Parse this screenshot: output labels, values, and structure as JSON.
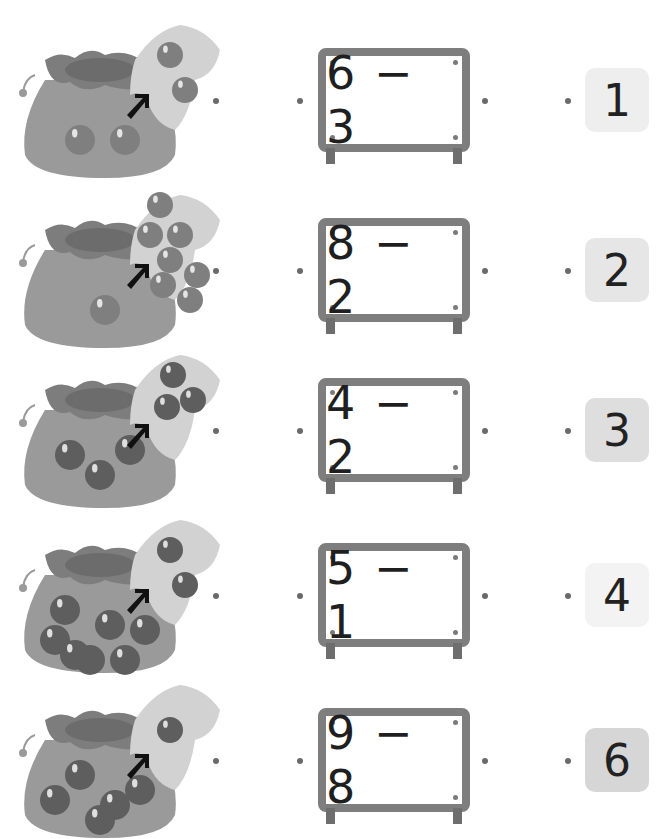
{
  "worksheet": {
    "rows": [
      {
        "bag_balls": 2,
        "hand_balls": 2,
        "expression": "6 − 3",
        "answer": "1",
        "answer_bg": "#eeeeee"
      },
      {
        "bag_balls": 1,
        "hand_balls": 7,
        "expression": "8 − 2",
        "answer": "2",
        "answer_bg": "#e6e6e6"
      },
      {
        "bag_balls": 3,
        "hand_balls": 3,
        "expression": "4 − 2",
        "answer": "3",
        "answer_bg": "#dedede"
      },
      {
        "bag_balls": 7,
        "hand_balls": 2,
        "expression": "5 − 1",
        "answer": "4",
        "answer_bg": "#f3f3f3"
      },
      {
        "bag_balls": 5,
        "hand_balls": 1,
        "expression": "9 − 8",
        "answer": "6",
        "answer_bg": "#d6d6d6"
      }
    ]
  },
  "colors": {
    "bag": "#9a9a9a",
    "bag_top": "#7d7d7d",
    "bag_inner": "#6c6c6c",
    "hand": "#d2d2d2",
    "ball": "#7f7f7f",
    "ball_dark": "#5e5e5e",
    "arrow": "#111111",
    "board_frame": "#7e7e7e",
    "connector_dot": "#6a6a6a"
  }
}
